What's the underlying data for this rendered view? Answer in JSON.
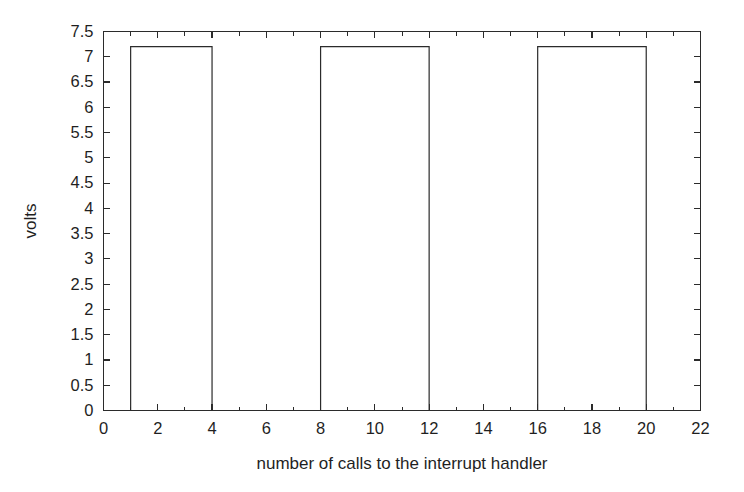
{
  "chart_data": {
    "type": "line",
    "title": "",
    "subtitle": "",
    "xlabel": "number of calls to the interrupt handler",
    "ylabel": "volts",
    "xlim": [
      0,
      22
    ],
    "ylim": [
      0,
      7.5
    ],
    "grid": false,
    "legend": null,
    "box": true,
    "tick_direction": "in",
    "line_color": "#2b2b2b",
    "background_color": "#ffffff",
    "xticks": [
      0,
      2,
      4,
      6,
      8,
      10,
      12,
      14,
      16,
      18,
      20,
      22
    ],
    "xtick_labels": [
      "0",
      "2",
      "4",
      "6",
      "8",
      "10",
      "12",
      "14",
      "16",
      "18",
      "20",
      "22"
    ],
    "x_minor_ticks": [
      1,
      3,
      5,
      7,
      9,
      11,
      13,
      15,
      17,
      19,
      21
    ],
    "yticks": [
      0,
      0.5,
      1,
      1.5,
      2,
      2.5,
      3,
      3.5,
      4,
      4.5,
      5,
      5.5,
      6,
      6.5,
      7,
      7.5
    ],
    "ytick_labels": [
      "0",
      "0.5",
      "1",
      "1.5",
      "2",
      "2.5",
      "3",
      "3.5",
      "4",
      "4.5",
      "5",
      "5.5",
      "6",
      "6.5",
      "7",
      "7.5"
    ],
    "waveform": {
      "description": "square wave pulse train",
      "low_level": 0,
      "high_level": 7.2,
      "pulses": [
        {
          "start": 1,
          "end": 4,
          "amplitude": 7.2
        },
        {
          "start": 8,
          "end": 12,
          "amplitude": 7.2
        },
        {
          "start": 16,
          "end": 20,
          "amplitude": 7.2
        }
      ]
    },
    "x": [
      0,
      1,
      1,
      4,
      4,
      8,
      8,
      12,
      12,
      16,
      16,
      20,
      20,
      22
    ],
    "y": [
      0,
      0,
      7.2,
      7.2,
      0,
      0,
      7.2,
      7.2,
      0,
      0,
      7.2,
      7.2,
      0,
      0
    ],
    "annotations": []
  }
}
